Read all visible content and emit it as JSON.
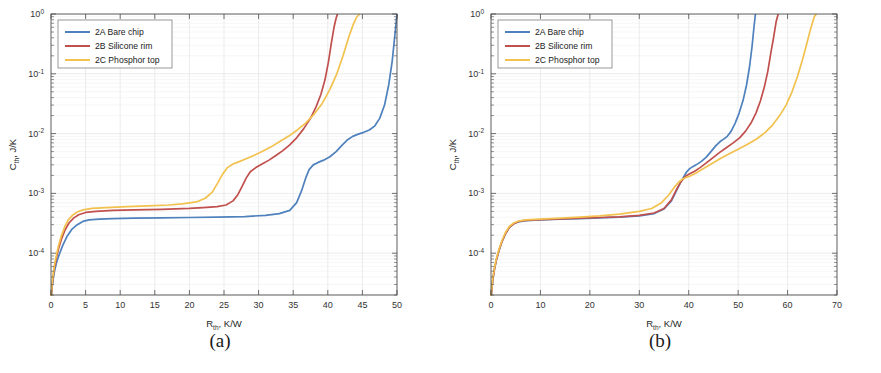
{
  "figure": {
    "panels": [
      {
        "caption": "(a)",
        "xlabel_main": "R",
        "xlabel_sub": "th",
        "xlabel_rest": ", K/W",
        "ylabel_main": "C",
        "ylabel_sub": "th",
        "ylabel_rest": ", J/K"
      },
      {
        "caption": "(b)",
        "xlabel_main": "R",
        "xlabel_sub": "th",
        "xlabel_rest": ", K/W",
        "ylabel_main": "C",
        "ylabel_sub": "th",
        "ylabel_rest": ", J/K"
      }
    ],
    "legend_entries": [
      {
        "label": "2A Bare chip",
        "color": "#4f81bd"
      },
      {
        "label": "2B Silicone rim",
        "color": "#c0504d"
      },
      {
        "label": "2C Phosphor top",
        "color": "#f2c14e"
      }
    ]
  },
  "chart_data": [
    {
      "type": "line",
      "panel": "(a)",
      "title": "",
      "xlabel": "R_th, K/W",
      "ylabel": "C_th, J/K",
      "xlim": [
        0,
        50
      ],
      "ylim": [
        2e-05,
        1
      ],
      "yscale": "log",
      "xticks": [
        0,
        5,
        10,
        15,
        20,
        25,
        30,
        35,
        40,
        45,
        50
      ],
      "yticks": [
        0.0001,
        0.001,
        0.01,
        0.1,
        1
      ],
      "yticklabels": [
        "10-4",
        "10-3",
        "10-2",
        "10-1",
        "100"
      ],
      "grid": true,
      "legend_position": "upper left",
      "series": [
        {
          "name": "2A Bare chip",
          "color": "#4f81bd",
          "x": [
            0.05,
            0.15,
            0.3,
            0.5,
            0.8,
            1.2,
            1.7,
            2.3,
            3.0,
            3.8,
            4.6,
            5.5,
            7.0,
            9.0,
            12.0,
            16.0,
            20.0,
            24.0,
            28.0,
            31.0,
            33.0,
            34.5,
            35.5,
            36.2,
            36.8,
            37.3,
            37.9,
            38.6,
            39.4,
            40.3,
            41.2,
            42.0,
            42.8,
            43.6,
            44.4,
            45.2,
            46.0,
            46.8,
            47.5,
            48.2,
            48.8,
            49.3,
            49.7,
            50.0
          ],
          "y": [
            2e-05,
            2.6e-05,
            3.6e-05,
            5e-05,
            7e-05,
            9.6e-05,
            0.000135,
            0.00019,
            0.00025,
            0.0003,
            0.00034,
            0.00036,
            0.00037,
            0.00038,
            0.000385,
            0.00039,
            0.000395,
            0.0004,
            0.00041,
            0.00043,
            0.00046,
            0.00052,
            0.0007,
            0.0011,
            0.0018,
            0.0025,
            0.003,
            0.0033,
            0.0036,
            0.0041,
            0.005,
            0.0063,
            0.0078,
            0.009,
            0.0098,
            0.0105,
            0.0115,
            0.0135,
            0.018,
            0.03,
            0.065,
            0.16,
            0.45,
            1.0
          ]
        },
        {
          "name": "2B Silicone rim",
          "color": "#c0504d",
          "x": [
            0.05,
            0.15,
            0.3,
            0.5,
            0.8,
            1.1,
            1.5,
            2.0,
            2.6,
            3.3,
            4.0,
            5.0,
            6.5,
            9.0,
            12.0,
            16.0,
            20.0,
            22.0,
            24.0,
            25.3,
            26.3,
            27.0,
            27.6,
            28.2,
            28.8,
            29.6,
            30.5,
            31.5,
            32.5,
            33.5,
            34.5,
            35.5,
            36.5,
            37.5,
            38.3,
            39.0,
            39.6,
            40.1,
            40.5,
            40.9,
            41.2,
            41.4
          ],
          "y": [
            2e-05,
            2.8e-05,
            4e-05,
            5.8e-05,
            8.5e-05,
            0.00012,
            0.00017,
            0.00024,
            0.00032,
            0.00039,
            0.00044,
            0.00048,
            0.0005,
            0.00052,
            0.00053,
            0.00054,
            0.00056,
            0.00058,
            0.0006,
            0.00064,
            0.00075,
            0.00095,
            0.0013,
            0.0018,
            0.0023,
            0.0027,
            0.0031,
            0.0036,
            0.0043,
            0.0052,
            0.0065,
            0.0085,
            0.012,
            0.018,
            0.028,
            0.045,
            0.08,
            0.16,
            0.32,
            0.6,
            0.85,
            1.0
          ]
        },
        {
          "name": "2C Phosphor top",
          "color": "#f2c14e",
          "x": [
            0.05,
            0.15,
            0.3,
            0.5,
            0.8,
            1.1,
            1.5,
            2.0,
            2.5,
            3.1,
            3.8,
            4.6,
            6.0,
            8.0,
            11.0,
            14.0,
            17.0,
            19.0,
            21.0,
            22.3,
            23.3,
            24.1,
            24.8,
            25.5,
            26.3,
            27.2,
            28.2,
            29.3,
            30.5,
            31.8,
            33.0,
            34.3,
            35.6,
            36.8,
            38.0,
            39.2,
            40.3,
            41.3,
            42.2,
            43.0,
            43.7,
            44.2,
            44.6
          ],
          "y": [
            2e-05,
            3e-05,
            4.3e-05,
            6.3e-05,
            9.5e-05,
            0.000135,
            0.000195,
            0.00028,
            0.00036,
            0.00043,
            0.00049,
            0.00053,
            0.00056,
            0.00058,
            0.0006,
            0.00062,
            0.00064,
            0.00067,
            0.00072,
            0.00083,
            0.00105,
            0.0015,
            0.0021,
            0.0027,
            0.0031,
            0.0034,
            0.0038,
            0.0043,
            0.005,
            0.006,
            0.0073,
            0.009,
            0.0115,
            0.015,
            0.021,
            0.032,
            0.055,
            0.1,
            0.2,
            0.4,
            0.68,
            0.9,
            1.0
          ]
        }
      ]
    },
    {
      "type": "line",
      "panel": "(b)",
      "title": "",
      "xlabel": "R_th, K/W",
      "ylabel": "C_th, J/K",
      "xlim": [
        0,
        70
      ],
      "ylim": [
        2e-05,
        1
      ],
      "yscale": "log",
      "xticks": [
        0,
        10,
        20,
        30,
        40,
        50,
        60,
        70
      ],
      "yticks": [
        0.0001,
        0.001,
        0.01,
        0.1,
        1
      ],
      "yticklabels": [
        "10-4",
        "10-3",
        "10-2",
        "10-1",
        "100"
      ],
      "grid": true,
      "legend_position": "upper left",
      "series": [
        {
          "name": "2A Bare chip",
          "color": "#4f81bd",
          "x": [
            0.05,
            0.2,
            0.4,
            0.7,
            1.1,
            1.6,
            2.2,
            2.9,
            3.7,
            4.6,
            5.6,
            7.0,
            10.0,
            14.0,
            18.0,
            22.0,
            26.0,
            30.0,
            33.0,
            35.0,
            36.5,
            37.5,
            38.3,
            39.0,
            39.6,
            40.2,
            40.8,
            41.5,
            42.5,
            43.5,
            44.5,
            45.5,
            46.3,
            47.0,
            47.8,
            48.6,
            49.4,
            50.2,
            51.0,
            51.7,
            52.3,
            52.8,
            53.2,
            53.5
          ],
          "y": [
            2e-05,
            2.7e-05,
            3.8e-05,
            5.4e-05,
            7.8e-05,
            0.00011,
            0.000155,
            0.00021,
            0.00027,
            0.00031,
            0.000335,
            0.00035,
            0.00036,
            0.00037,
            0.00038,
            0.00039,
            0.0004,
            0.00042,
            0.00046,
            0.00055,
            0.00075,
            0.0011,
            0.0015,
            0.0019,
            0.0023,
            0.0026,
            0.0028,
            0.003,
            0.0034,
            0.004,
            0.005,
            0.0063,
            0.0073,
            0.008,
            0.009,
            0.011,
            0.015,
            0.022,
            0.036,
            0.065,
            0.13,
            0.28,
            0.6,
            1.0
          ]
        },
        {
          "name": "2B Silicone rim",
          "color": "#c0504d",
          "x": [
            0.05,
            0.2,
            0.4,
            0.7,
            1.1,
            1.6,
            2.2,
            2.9,
            3.7,
            4.6,
            5.6,
            7.0,
            10.0,
            14.0,
            18.0,
            22.0,
            26.0,
            30.0,
            33.0,
            35.0,
            36.5,
            37.5,
            38.3,
            39.0,
            39.6,
            40.3,
            41.2,
            42.3,
            43.5,
            44.8,
            46.2,
            47.6,
            49.0,
            50.3,
            51.5,
            52.6,
            53.6,
            54.5,
            55.3,
            56.0,
            56.6,
            57.2,
            57.7,
            58.1
          ],
          "y": [
            2e-05,
            2.7e-05,
            3.8e-05,
            5.4e-05,
            7.8e-05,
            0.00011,
            0.000155,
            0.00021,
            0.00027,
            0.00031,
            0.00034,
            0.000355,
            0.000365,
            0.000375,
            0.000385,
            0.000395,
            0.000405,
            0.00043,
            0.00047,
            0.00056,
            0.00078,
            0.00115,
            0.0015,
            0.0018,
            0.002,
            0.00215,
            0.00235,
            0.0027,
            0.0032,
            0.0039,
            0.0048,
            0.0058,
            0.007,
            0.0085,
            0.011,
            0.015,
            0.022,
            0.035,
            0.06,
            0.11,
            0.22,
            0.42,
            0.75,
            1.0
          ]
        },
        {
          "name": "2C Phosphor top",
          "color": "#f2c14e",
          "x": [
            0.05,
            0.2,
            0.4,
            0.7,
            1.1,
            1.6,
            2.2,
            2.9,
            3.7,
            4.6,
            5.6,
            7.0,
            10.0,
            14.0,
            18.0,
            22.0,
            26.0,
            30.0,
            32.5,
            34.5,
            36.0,
            37.2,
            38.0,
            38.8,
            39.5,
            40.3,
            41.5,
            43.0,
            44.8,
            46.6,
            48.4,
            50.2,
            52.0,
            53.8,
            55.5,
            57.0,
            58.4,
            59.7,
            60.9,
            62.0,
            63.0,
            63.9,
            64.7,
            65.4,
            65.8
          ],
          "y": [
            2e-05,
            2.8e-05,
            4e-05,
            5.7e-05,
            8.2e-05,
            0.000115,
            0.00016,
            0.00022,
            0.00028,
            0.00032,
            0.000345,
            0.00036,
            0.00037,
            0.000385,
            0.0004,
            0.00042,
            0.00045,
            0.0005,
            0.00056,
            0.0007,
            0.00095,
            0.0013,
            0.00155,
            0.00175,
            0.00185,
            0.00195,
            0.0022,
            0.0026,
            0.0032,
            0.0039,
            0.0047,
            0.0056,
            0.0067,
            0.0082,
            0.0105,
            0.014,
            0.02,
            0.03,
            0.05,
            0.09,
            0.17,
            0.32,
            0.58,
            0.9,
            1.0
          ]
        }
      ]
    }
  ]
}
